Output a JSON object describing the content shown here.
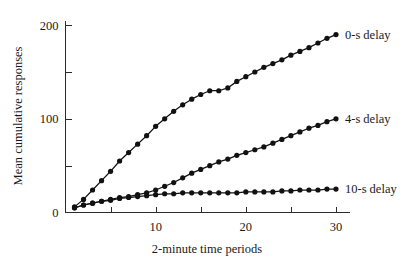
{
  "chart_data": {
    "type": "line",
    "title": "",
    "xlabel": "2-minute time periods",
    "ylabel": "Mean cumulative responses",
    "xlim": [
      0,
      31.5
    ],
    "ylim": [
      0,
      205
    ],
    "grid": false,
    "legend_position": "right-of-line-ends",
    "x_ticks_major": [
      10,
      20,
      30
    ],
    "x_ticks_minor": [
      5,
      15,
      25
    ],
    "x_tick_labels": [
      "10",
      "20",
      "30"
    ],
    "y_ticks_major": [
      0,
      100,
      200
    ],
    "y_ticks_minor": [
      50,
      150
    ],
    "y_tick_labels": [
      "0",
      "100",
      "200"
    ],
    "marker": "filled-circle",
    "x": [
      1,
      2,
      3,
      4,
      5,
      6,
      7,
      8,
      9,
      10,
      11,
      12,
      13,
      14,
      15,
      16,
      17,
      18,
      19,
      20,
      21,
      22,
      23,
      24,
      25,
      26,
      27,
      28,
      29,
      30
    ],
    "series": [
      {
        "name": "0-s delay",
        "label": "0-s delay",
        "color": "#111111",
        "values": [
          6,
          14,
          24,
          34,
          44,
          55,
          64,
          73,
          82,
          92,
          100,
          108,
          115,
          121,
          126,
          130,
          130,
          133,
          140,
          145,
          150,
          155,
          159,
          163,
          168,
          172,
          176,
          181,
          186,
          190
        ]
      },
      {
        "name": "4-s delay",
        "label": "4-s delay",
        "color": "#111111",
        "values": [
          5,
          8,
          10,
          12,
          14,
          16,
          17,
          19,
          21,
          24,
          28,
          32,
          37,
          42,
          46,
          50,
          54,
          57,
          61,
          64,
          67,
          70,
          74,
          78,
          82,
          86,
          90,
          93,
          97,
          100
        ]
      },
      {
        "name": "10-s delay",
        "label": "10-s delay",
        "color": "#111111",
        "values": [
          5,
          8,
          10,
          12,
          13,
          15,
          16,
          17,
          18,
          19,
          20,
          20,
          21,
          21,
          21,
          21,
          21,
          21,
          21,
          22,
          22,
          22,
          22,
          23,
          23,
          24,
          24,
          24,
          25,
          25
        ]
      }
    ]
  },
  "figure": {
    "background_color": "#ffffff",
    "ink_color": "#111111"
  }
}
